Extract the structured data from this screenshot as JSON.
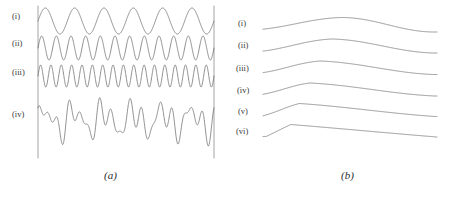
{
  "figure": {
    "background_color": "#ffffff",
    "line_color": "#6b6b6b",
    "axis_color": "#9a9a9a",
    "text_color": "#3a3a3a"
  },
  "panel_a": {
    "caption": "(a)",
    "caption_x": 104,
    "caption_y": 170,
    "axis_left_x": 38,
    "axis_right_x": 214,
    "axis_top_y": 6,
    "axis_bottom_y": 158,
    "labels": [
      {
        "text": "(i)",
        "x": 12,
        "y": 18
      },
      {
        "text": "(ii)",
        "x": 12,
        "y": 45
      },
      {
        "text": "(iii)",
        "x": 12,
        "y": 74
      },
      {
        "text": "(iv)",
        "x": 12,
        "y": 116
      }
    ]
  },
  "panel_b": {
    "caption": "(b)",
    "caption_x": 341,
    "caption_y": 170,
    "labels": [
      {
        "text": "(i)",
        "x": 238,
        "y": 25
      },
      {
        "text": "(ii)",
        "x": 238,
        "y": 47
      },
      {
        "text": "(iii)",
        "x": 236,
        "y": 70
      },
      {
        "text": "(iv)",
        "x": 237,
        "y": 92
      },
      {
        "text": "(v)",
        "x": 238,
        "y": 113
      },
      {
        "text": "(vi)",
        "x": 236,
        "y": 133
      }
    ]
  },
  "chart_data": [
    {
      "type": "line",
      "panel": "a",
      "title": "(a)",
      "xlabel": "",
      "ylabel": "",
      "grid": false,
      "legend": "inline-left-labels",
      "x_range": [
        0,
        1
      ],
      "description": "Four stacked oscillatory time traces sharing a common horizontal span bounded by two vertical rules; traces (i)-(iii) are sinusoids of increasing frequency, trace (iv) is their superposition.",
      "series": [
        {
          "name": "(i)",
          "waveform": "sine",
          "cycles": 6,
          "amplitude": 1.0,
          "baseline_y": 21,
          "pixel_amplitude": 13,
          "phase": 0.0
        },
        {
          "name": "(ii)",
          "waveform": "sine",
          "cycles": 12,
          "amplitude": 1.0,
          "baseline_y": 48,
          "pixel_amplitude": 12,
          "phase": 0.0
        },
        {
          "name": "(iii)",
          "waveform": "sine",
          "cycles": 17,
          "amplitude": 1.0,
          "baseline_y": 76,
          "pixel_amplitude": 11,
          "phase": 0.0
        },
        {
          "name": "(iv)",
          "waveform": "sum-of-(i)-(ii)-(iii)",
          "cycles": 0,
          "amplitude": 3.0,
          "baseline_y": 120,
          "pixel_amplitude": 12,
          "phase": 0.0,
          "components": [
            {
              "cycles": 6,
              "weight": 1.0,
              "phase": 0.0
            },
            {
              "cycles": 12,
              "weight": 0.85,
              "phase": 0.6
            },
            {
              "cycles": 17,
              "weight": 0.7,
              "phase": 1.9
            }
          ]
        }
      ]
    },
    {
      "type": "line",
      "panel": "b",
      "title": "(b)",
      "xlabel": "",
      "ylabel": "",
      "grid": false,
      "legend": "inline-left-labels",
      "x_start_px": 263,
      "x_end_px": 437,
      "description": "Six stacked spectral-envelope curves; each rises from the left, reaches a maximum, then decays to the right. Going from (i) to (vi) the maximum shifts progressively leftward and becomes sharper, ending as an almost triangular cusp.",
      "series": [
        {
          "name": "(i)",
          "baseline_y": 28,
          "peak_fraction": 0.46,
          "peak_height": 10.5,
          "left_offset": 2.0,
          "right_offset": 4.0,
          "sharpness": 0.1
        },
        {
          "name": "(ii)",
          "baseline_y": 50,
          "peak_fraction": 0.4,
          "peak_height": 11.0,
          "left_offset": 2.0,
          "right_offset": 3.0,
          "sharpness": 0.22
        },
        {
          "name": "(iii)",
          "baseline_y": 72,
          "peak_fraction": 0.33,
          "peak_height": 11.0,
          "left_offset": 1.5,
          "right_offset": 2.5,
          "sharpness": 0.34
        },
        {
          "name": "(iv)",
          "baseline_y": 94,
          "peak_fraction": 0.27,
          "peak_height": 11.0,
          "left_offset": 1.0,
          "right_offset": 2.0,
          "sharpness": 0.5
        },
        {
          "name": "(v)",
          "baseline_y": 115,
          "peak_fraction": 0.21,
          "peak_height": 11.5,
          "left_offset": 1.0,
          "right_offset": 1.5,
          "sharpness": 0.72
        },
        {
          "name": "(vi)",
          "baseline_y": 136,
          "peak_fraction": 0.16,
          "peak_height": 11.5,
          "left_offset": 0.5,
          "right_offset": 1.0,
          "sharpness": 0.95
        }
      ]
    }
  ]
}
